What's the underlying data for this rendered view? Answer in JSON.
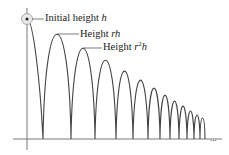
{
  "figure": {
    "labels": {
      "initial": {
        "text": "Initial height ",
        "var": "h"
      },
      "first": {
        "text": "Height ",
        "var": "rh"
      },
      "second": {
        "text": "Height ",
        "var_base": "r",
        "var_exp": "2",
        "var_tail": "h"
      }
    },
    "ellipsis": "...",
    "colors": {
      "curve": "#444444",
      "axis": "#555555",
      "circle": "#999999",
      "text": "#222222"
    }
  },
  "geometry": {
    "baseline_y": 139,
    "axis_x": 27,
    "start": [
      27,
      19
    ],
    "bounces_x": [
      43,
      71,
      95,
      116,
      133,
      148,
      160,
      170,
      179,
      187,
      194,
      200,
      205
    ],
    "peak_y": [
      34,
      48,
      60,
      71,
      80,
      88,
      95,
      101,
      106,
      111,
      115,
      118
    ]
  }
}
